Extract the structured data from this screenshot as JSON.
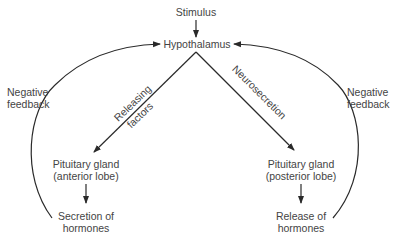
{
  "diagram": {
    "nodes": {
      "stimulus": "Stimulus",
      "hypothalamus": "Hypothalamus",
      "anterior": {
        "line1": "Pituitary gland",
        "line2": "(anterior lobe)"
      },
      "posterior": {
        "line1": "Pituitary gland",
        "line2": "(posterior lobe)"
      },
      "secretion": {
        "line1": "Secretion of",
        "line2": "hormones"
      },
      "release": {
        "line1": "Release of",
        "line2": "hormones"
      }
    },
    "edges": {
      "releasing": {
        "line1": "Releasing",
        "line2": "factors"
      },
      "neurosecretion": "Neurosecretion",
      "feedback_left": {
        "line1": "Negative",
        "line2": "feedback"
      },
      "feedback_right": {
        "line1": "Negative",
        "line2": "feedback"
      }
    },
    "colors": {
      "line": "#2a2a2a",
      "text": "#444444",
      "background": "#ffffff"
    }
  }
}
